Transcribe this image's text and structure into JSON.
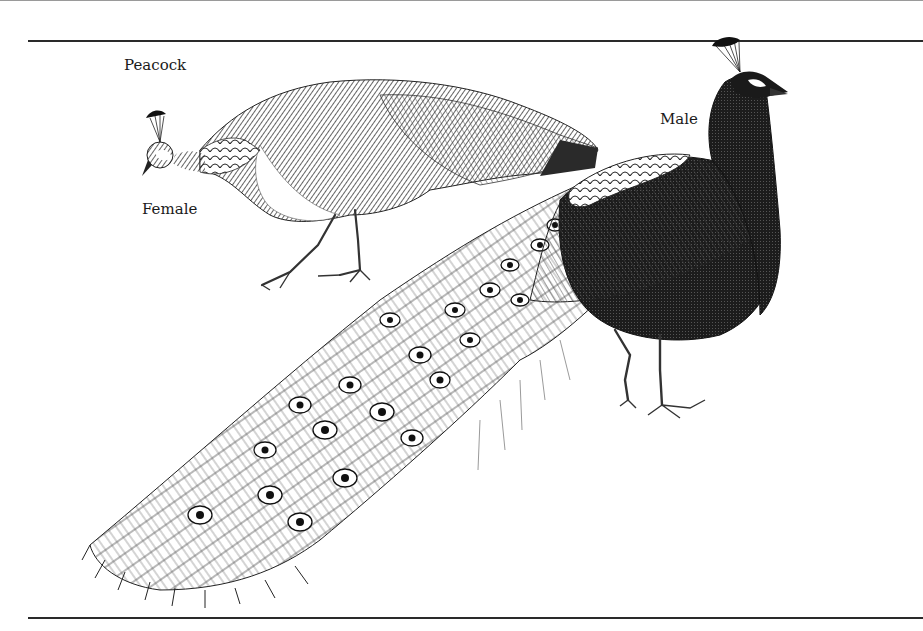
{
  "labels": {
    "title": "Peacock",
    "female": "Female",
    "male": "Male"
  },
  "colors": {
    "ink": "#1a1a1a",
    "paper": "#ffffff",
    "rule": "#2a2a2a"
  },
  "illustration": {
    "subjects": [
      "female-peafowl",
      "male-peacock"
    ],
    "style": "pen-and-ink engraving"
  }
}
